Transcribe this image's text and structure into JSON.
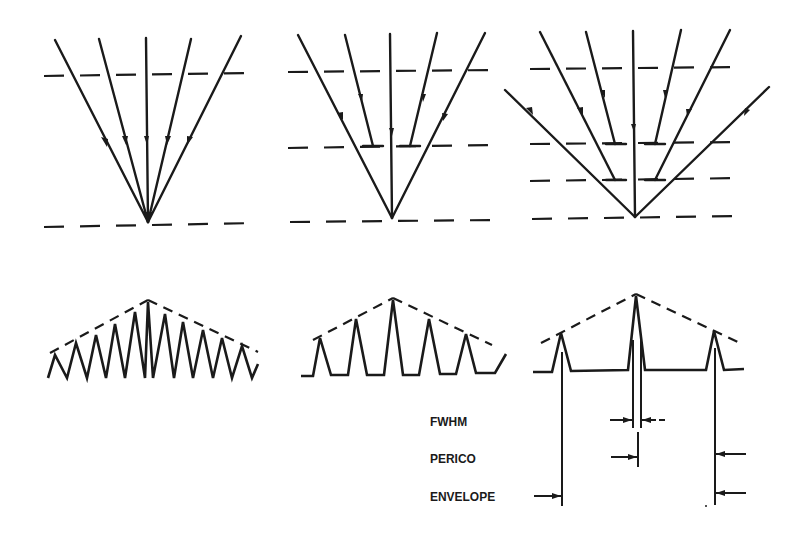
{
  "diagram": {
    "type": "optics-schematic",
    "colors": {
      "ink": "#1a1a1a",
      "background": "#ffffff"
    },
    "panels": [
      {
        "id": "panel-1",
        "rays": 5,
        "dashed_planes": 2,
        "fringe_peaks": 11
      },
      {
        "id": "panel-2",
        "rays": 5,
        "dashed_planes": 3,
        "fringe_peaks": 5
      },
      {
        "id": "panel-3",
        "rays": 7,
        "dashed_planes": 4,
        "fringe_peaks": 3
      }
    ],
    "labels": {
      "fwhm": "FWHM",
      "period": "PERICO",
      "envelope": "ENVELOPE"
    }
  }
}
